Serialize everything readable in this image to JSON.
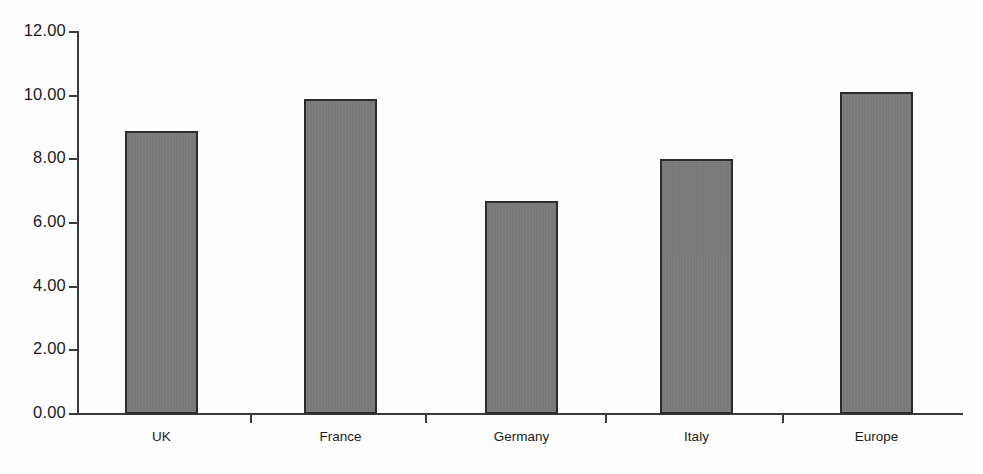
{
  "chart_data": {
    "type": "bar",
    "title": "",
    "subtitle": "",
    "xlabel": "",
    "ylabel": "",
    "categories": [
      "UK",
      "France",
      "Germany",
      "Italy",
      "Europe"
    ],
    "values": [
      8.9,
      9.9,
      6.7,
      8.0,
      10.1
    ],
    "ylim": [
      0.0,
      12.0
    ],
    "ytick_values": [
      0.0,
      2.0,
      4.0,
      6.0,
      8.0,
      10.0,
      12.0
    ],
    "ytick_labels": [
      "0.00",
      "2.00",
      "4.00",
      "6.00",
      "8.00",
      "10.00",
      "12.00"
    ],
    "grid": false,
    "legend": null,
    "legend_position": "none",
    "annotations": [],
    "colors": {
      "bar_fill": "#7a7a7a",
      "bar_border": "#2b2b2b",
      "axis": "#3b3b3b",
      "text": "#1b1b1b",
      "background": "#fdfdfd"
    }
  }
}
